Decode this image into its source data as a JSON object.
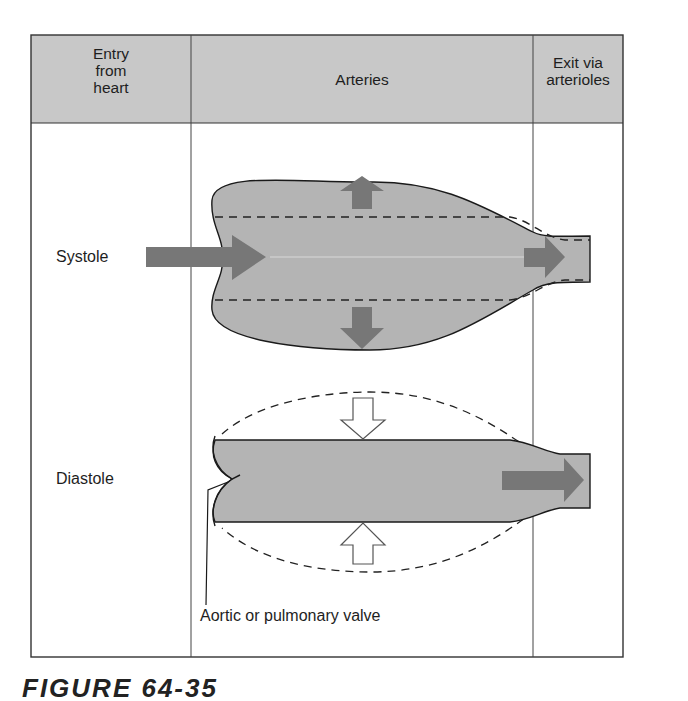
{
  "table": {
    "columns": [
      {
        "label": "Entry\nfrom\nheart",
        "lines": [
          "Entry",
          "from",
          "heart"
        ]
      },
      {
        "label": "Arteries"
      },
      {
        "label": "Exit via\narterioles",
        "lines": [
          "Exit via",
          "arterioles"
        ]
      }
    ],
    "header_fill": "#c8c8c8"
  },
  "rows": {
    "systole": {
      "label": "Systole"
    },
    "diastole": {
      "label": "Diastole"
    }
  },
  "annotations": {
    "valve_label": "Aortic or pulmonary valve"
  },
  "caption": {
    "text": "FIGURE 64-35"
  },
  "colors": {
    "vessel_fill": "#b4b4b4",
    "arrow_fill": "#777777",
    "outline": "#1a1a1a",
    "border": "#333333"
  }
}
